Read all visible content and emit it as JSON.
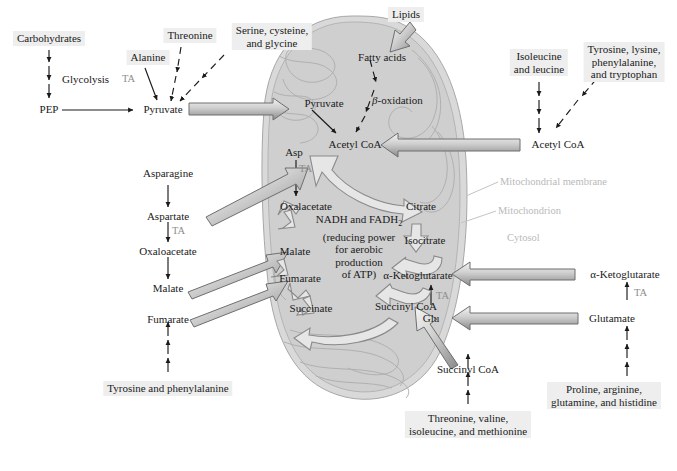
{
  "figure": {
    "colors": {
      "label_box_bg": "#eeeeee",
      "mitochondrion_fill": "#d9d9d9",
      "matrix_fill": "#cfcfcf",
      "cristae_stroke": "#b0b0b0",
      "thick_arrow_light": "#f2f2f2",
      "thick_arrow_dark": "#8a8a8a",
      "text": "#1a1a1a",
      "ta_gray": "#8d8d8d",
      "annotation_gray": "#b9b9b9"
    }
  },
  "cytosol_left": {
    "carbohydrates": "Carbohydrates",
    "glycolysis": "Glycolysis",
    "pep": "PEP",
    "pyruvate": "Pyruvate",
    "alanine": "Alanine",
    "alanine_ta": "TA",
    "threonine": "Threonine",
    "serine_cysteine_glycine_line1": "Serine, cysteine,",
    "serine_cysteine_glycine_line2": "and glycine",
    "asparagine": "Asparagine",
    "aspartate": "Aspartate",
    "aspartate_ta": "TA",
    "oxaloacetate": "Oxaloacetate",
    "malate": "Malate",
    "fumarate": "Fumarate",
    "tyrosine_phenylalanine": "Tyrosine and phenylalanine"
  },
  "cytosol_top": {
    "lipids": "Lipids"
  },
  "cytosol_right": {
    "isoleucine_leucine_line1": "Isoleucine",
    "isoleucine_leucine_line2": "and leucine",
    "tyrosine_group_line1": "Tyrosine, lysine,",
    "tyrosine_group_line2": "phenylalanine,",
    "tyrosine_group_line3": "and tryptophan",
    "acetyl_coa": "Acetyl CoA",
    "alpha_ketoglutarate": "α-Ketoglutarate",
    "glutamate": "Glutamate",
    "glutamate_ta": "TA",
    "proline_group_line1": "Proline, arginine,",
    "proline_group_line2": "glutamine, and histidine"
  },
  "cytosol_bottom": {
    "succinyl_coa": "Succinyl CoA",
    "threonine_group_line1": "Threonine, valine,",
    "threonine_group_line2": "isoleucine, and methionine"
  },
  "mitochondrion": {
    "pyruvate": "Pyruvate",
    "fatty_acids": "Fatty acids",
    "beta_oxidation_italic": "β",
    "beta_oxidation_rest": "-oxidation",
    "acetyl_coa": "Acetyl CoA",
    "asp": "Asp",
    "asp_ta": "TA",
    "oxalacetate": "Oxalacetate",
    "citrate": "Citrate",
    "isocitrate": "Isocitrate",
    "alpha_ketoglutarate": "α-Ketoglutarate",
    "succinyl_coa": "Succinyl CoA",
    "succinate": "Succinate",
    "fumarate": "Fumarate",
    "malate": "Malate",
    "glu": "Glu",
    "glu_ta": "TA",
    "center_line1_a": "NADH and FADH",
    "center_line1_sub": "2",
    "center_line2": "(reducing power",
    "center_line3": "for aerobic",
    "center_line4": "production",
    "center_line5": "of ATP)"
  },
  "annotations": {
    "mitochondrial_membrane": "Mitochondrial membrane",
    "mitochondrion": "Mitochondrion",
    "cytosol": "Cytosol"
  }
}
